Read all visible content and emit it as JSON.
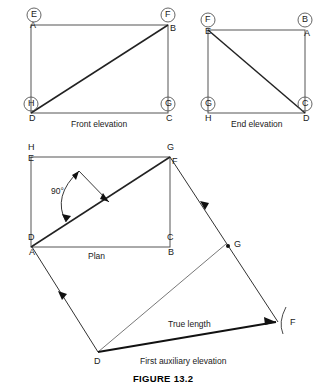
{
  "figure": {
    "number": "FIGURE 13.2",
    "views": [
      {
        "id": "front-elevation",
        "caption": "Front elevation",
        "rect": {
          "x": 31,
          "y": 25,
          "w": 137,
          "h": 88
        },
        "diagonal": "bottom-left-to-top-right",
        "corners": [
          {
            "pos": "top-left",
            "circled": "E",
            "plain": "A"
          },
          {
            "pos": "top-right",
            "circled": "F",
            "plain": "B"
          },
          {
            "pos": "bottom-left",
            "circled": "H",
            "plain": "D"
          },
          {
            "pos": "bottom-right",
            "circled": "G",
            "plain": "C"
          }
        ]
      },
      {
        "id": "end-elevation",
        "caption": "End elevation",
        "rect": {
          "x": 208,
          "y": 30,
          "w": 97,
          "h": 83
        },
        "diagonal": "top-left-to-bottom-right",
        "corners": [
          {
            "pos": "top-left",
            "circled": "F",
            "plain": "E"
          },
          {
            "pos": "top-right",
            "circled": "B",
            "plain": "A"
          },
          {
            "pos": "bottom-left",
            "circled": "G",
            "plain": "H"
          },
          {
            "pos": "bottom-right",
            "circled": "C",
            "plain": "D"
          }
        ]
      },
      {
        "id": "plan",
        "caption": "Plan",
        "rect": {
          "x": 31,
          "y": 157,
          "w": 139,
          "h": 90
        },
        "diagonal": "bottom-left-to-top-right",
        "angle_label": "90°",
        "corners": [
          {
            "pos": "top-left",
            "circled": "H",
            "plain": "E"
          },
          {
            "pos": "top-right",
            "circled": "G",
            "plain": "F"
          },
          {
            "pos": "bottom-left",
            "circled": "D",
            "plain": "A"
          },
          {
            "pos": "bottom-right",
            "circled": "C",
            "plain": "B"
          }
        ]
      },
      {
        "id": "first-auxiliary-elevation",
        "caption": "First auxiliary elevation",
        "true_length_label": "True length",
        "points": [
          {
            "name": "G",
            "x": 228,
            "y": 246
          },
          {
            "name": "F",
            "x": 278,
            "y": 322
          },
          {
            "name": "D",
            "x": 98,
            "y": 352
          }
        ]
      }
    ]
  },
  "colors": {
    "line": "#3a3a3a",
    "heavy_line": "#1a1a1a",
    "text": "#1a1a1a",
    "background": "#ffffff"
  }
}
